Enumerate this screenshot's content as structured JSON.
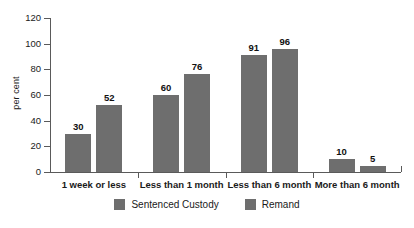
{
  "chart_data": {
    "type": "bar",
    "title": "",
    "subtitle": "",
    "xlabel": "",
    "ylabel": "per cent",
    "ylim": [
      0,
      120
    ],
    "yticks": [
      0,
      20,
      40,
      60,
      80,
      100,
      120
    ],
    "grid": false,
    "legend_position": "bottom",
    "categories": [
      "1 week or less",
      "Less than 1 month",
      "Less than 6 month",
      "More than 6 month"
    ],
    "series": [
      {
        "name": "Sentenced Custody",
        "color": "#6e6e6e",
        "values": [
          30,
          60,
          91,
          10
        ]
      },
      {
        "name": "Remand",
        "color": "#6e6e6e",
        "values": [
          52,
          76,
          96,
          5
        ]
      }
    ],
    "data_labels": [
      "30",
      "52",
      "60",
      "76",
      "91",
      "96",
      "10",
      "5"
    ]
  },
  "axis": {
    "y_tick_labels": [
      "120",
      "100",
      "80",
      "60",
      "40",
      "20",
      "0"
    ],
    "y_title": "per cent"
  },
  "legend": {
    "items": [
      {
        "label": "Sentenced Custody",
        "color": "#6e6e6e"
      },
      {
        "label": "Remand",
        "color": "#6e6e6e"
      }
    ]
  }
}
